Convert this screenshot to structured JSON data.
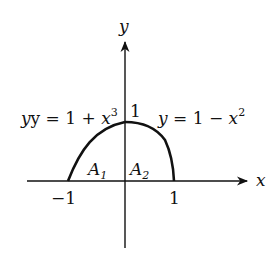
{
  "diagram": {
    "axes": {
      "x_label": "x",
      "y_label": "y",
      "x_ticks": [
        "−1",
        "1"
      ],
      "y_tick": "1"
    },
    "curves": [
      {
        "name": "left",
        "equation_lhs": "y = 1 + ",
        "equation_var": "x",
        "equation_exp": "3",
        "domain": [
          -1,
          0
        ]
      },
      {
        "name": "right",
        "equation_lhs": "y = 1 − ",
        "equation_var": "x",
        "equation_exp": "2",
        "domain": [
          0,
          1
        ]
      }
    ],
    "regions": [
      {
        "letter": "A",
        "subscript": "1"
      },
      {
        "letter": "A",
        "subscript": "2"
      }
    ],
    "colors": {
      "ink": "#111111",
      "background": "#ffffff"
    }
  }
}
